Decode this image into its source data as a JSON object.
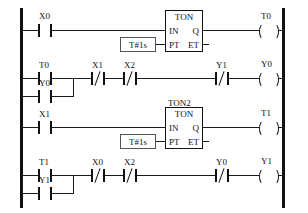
{
  "diagram": {
    "type": "ladder-logic",
    "rails": {
      "left": "power-rail-left",
      "right": "power-rail-right"
    },
    "rungs": [
      {
        "id": "rung-1",
        "contacts": [
          {
            "label": "X0",
            "type": "NO"
          }
        ],
        "block": {
          "name": "",
          "title": "TON",
          "in_label": "IN",
          "out_label": "Q",
          "pt_label": "PT",
          "et_label": "ET",
          "preset": "T#1s"
        },
        "coil": {
          "label": "T0"
        }
      },
      {
        "id": "rung-2",
        "contacts": [
          {
            "label": "T0",
            "type": "NO"
          },
          {
            "label": "X1",
            "type": "NC"
          },
          {
            "label": "X2",
            "type": "NC"
          },
          {
            "label": "Y1",
            "type": "NC"
          }
        ],
        "branch": {
          "label": "Y0",
          "type": "NO"
        },
        "coil": {
          "label": "Y0"
        }
      },
      {
        "id": "rung-3",
        "contacts": [
          {
            "label": "X1",
            "type": "NO"
          }
        ],
        "block": {
          "name": "TON2",
          "title": "TON",
          "in_label": "IN",
          "out_label": "Q",
          "pt_label": "PT",
          "et_label": "ET",
          "preset": "T#1s"
        },
        "coil": {
          "label": "T1"
        }
      },
      {
        "id": "rung-4",
        "contacts": [
          {
            "label": "T1",
            "type": "NO"
          },
          {
            "label": "X0",
            "type": "NC"
          },
          {
            "label": "X2",
            "type": "NC"
          },
          {
            "label": "Y0",
            "type": "NC"
          }
        ],
        "branch": {
          "label": "Y1",
          "type": "NO"
        },
        "coil": {
          "label": "Y1"
        }
      }
    ],
    "colors": {
      "line": "#111111",
      "background": "#ffffff",
      "literal_border": "#555555"
    }
  }
}
